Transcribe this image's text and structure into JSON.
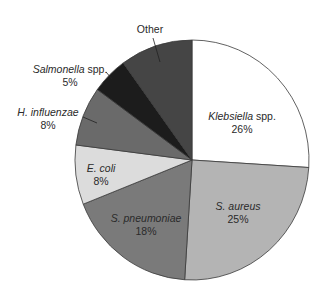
{
  "chart_data": {
    "type": "pie",
    "title": "",
    "start_angle_deg": 0,
    "direction": "clockwise",
    "slices": [
      {
        "label_italic": "Klebsiella",
        "label_rest": " spp.",
        "label": "Klebsiella spp.",
        "value": 26,
        "pct_text": "26%",
        "color": "#ffffff"
      },
      {
        "label_italic": "S. aureus",
        "label_rest": "",
        "label": "S. aureus",
        "value": 25,
        "pct_text": "25%",
        "color": "#b4b4b4"
      },
      {
        "label_italic": "S. pneumoniae",
        "label_rest": "",
        "label": "S. pneumoniae",
        "value": 18,
        "pct_text": "18%",
        "color": "#7a7a7a"
      },
      {
        "label_italic": "E. coli",
        "label_rest": "",
        "label": "E. coli",
        "value": 8,
        "pct_text": "8%",
        "color": "#dcdcdc"
      },
      {
        "label_italic": "H. influenzae",
        "label_rest": "",
        "label": "H. influenzae",
        "value": 8,
        "pct_text": "8%",
        "color": "#6a6a6a"
      },
      {
        "label_italic": "Salmonella",
        "label_rest": " spp.",
        "label": "Salmonella spp.",
        "value": 5,
        "pct_text": "5%",
        "color": "#1c1c1c"
      },
      {
        "label_italic": "",
        "label_rest": "Other",
        "label": "Other",
        "value": 10,
        "pct_text": "",
        "color": "#454545"
      }
    ]
  }
}
